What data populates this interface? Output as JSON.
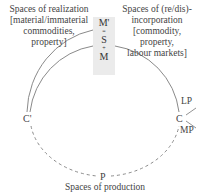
{
  "labels": {
    "realization": [
      "Spaces of realization",
      "[material/immaterial",
      "commodities,",
      "property]"
    ],
    "incorporation": [
      "Spaces of (re/dis)-",
      "incorporation",
      "[commodity,",
      "property,",
      "labour markets]"
    ],
    "production": "Spaces of production"
  },
  "stack": {
    "top": "M'",
    "sep1": "=",
    "mid": "S",
    "sep2": "+",
    "bottom": "M"
  },
  "nodes": {
    "c_prime": "C'",
    "c": "C",
    "p": "P",
    "lp": "LP",
    "mp": "MP"
  },
  "colors": {
    "line": "#888888",
    "stack_bg": "#ebebeb",
    "text": "#444444"
  }
}
